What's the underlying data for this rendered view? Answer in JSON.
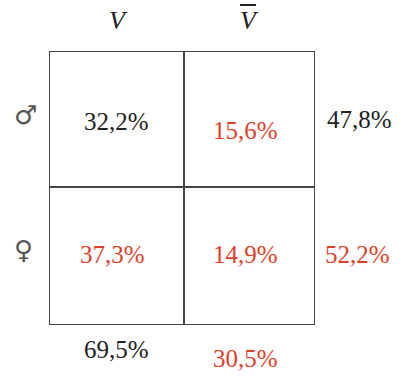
{
  "columns": [
    {
      "label": "V",
      "overline": false
    },
    {
      "label": "V",
      "overline": true
    }
  ],
  "rows": [
    {
      "symbol": "♂",
      "symbol_name": "male"
    },
    {
      "symbol": "♀",
      "symbol_name": "female"
    }
  ],
  "cells": {
    "male_v": "32,2%",
    "male_notv": "15,6%",
    "female_v": "37,3%",
    "female_notv": "14,9%"
  },
  "row_totals": {
    "male": "47,8%",
    "female": "52,2%"
  },
  "col_totals": {
    "v": "69,5%",
    "notv": "30,5%"
  },
  "colors": {
    "highlight": "#e0402a",
    "text": "#222222",
    "grid": "#444444"
  }
}
